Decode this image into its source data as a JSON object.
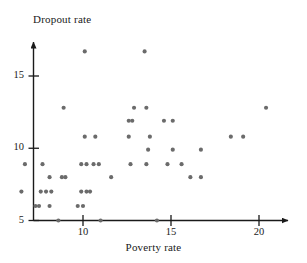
{
  "chart_data": {
    "type": "scatter",
    "title": "",
    "xlabel": "Poverty rate",
    "ylabel": "Dropout rate",
    "xlim": [
      6.2,
      21.6
    ],
    "ylim": [
      4.7,
      17.6
    ],
    "xticks": [
      10,
      15,
      20
    ],
    "yticks": [
      5,
      10,
      15
    ],
    "xtick_labels": [
      "10",
      "15",
      "20"
    ],
    "ytick_labels": [
      "5",
      "10",
      "15"
    ],
    "grid": false,
    "legend": null,
    "marker": {
      "shape": "circle",
      "color": "#6b6b6b",
      "size": 3.0
    },
    "axis_style": {
      "spines": [
        "left",
        "bottom"
      ],
      "arrow_heads": true,
      "color": "#1a1a1a"
    },
    "points": [
      {
        "x": 10.1,
        "y": 16.7
      },
      {
        "x": 13.5,
        "y": 16.7
      },
      {
        "x": 8.9,
        "y": 12.8
      },
      {
        "x": 12.9,
        "y": 12.8
      },
      {
        "x": 13.6,
        "y": 12.8
      },
      {
        "x": 20.4,
        "y": 12.8
      },
      {
        "x": 12.6,
        "y": 11.9
      },
      {
        "x": 12.8,
        "y": 11.9
      },
      {
        "x": 14.6,
        "y": 11.9
      },
      {
        "x": 15.1,
        "y": 11.9
      },
      {
        "x": 10.1,
        "y": 10.8
      },
      {
        "x": 10.7,
        "y": 10.8
      },
      {
        "x": 12.6,
        "y": 10.8
      },
      {
        "x": 13.8,
        "y": 10.8
      },
      {
        "x": 18.4,
        "y": 10.8
      },
      {
        "x": 19.1,
        "y": 10.8
      },
      {
        "x": 13.7,
        "y": 9.9
      },
      {
        "x": 15.1,
        "y": 9.9
      },
      {
        "x": 16.7,
        "y": 9.9
      },
      {
        "x": 6.7,
        "y": 8.9
      },
      {
        "x": 7.7,
        "y": 8.9
      },
      {
        "x": 9.9,
        "y": 8.9
      },
      {
        "x": 10.2,
        "y": 8.9
      },
      {
        "x": 10.6,
        "y": 8.9
      },
      {
        "x": 10.9,
        "y": 8.9
      },
      {
        "x": 12.7,
        "y": 8.9
      },
      {
        "x": 13.6,
        "y": 8.9
      },
      {
        "x": 14.8,
        "y": 8.9
      },
      {
        "x": 15.6,
        "y": 8.9
      },
      {
        "x": 8.1,
        "y": 8.0
      },
      {
        "x": 8.8,
        "y": 8.0
      },
      {
        "x": 9.0,
        "y": 8.0
      },
      {
        "x": 11.6,
        "y": 8.0
      },
      {
        "x": 16.1,
        "y": 8.0
      },
      {
        "x": 16.7,
        "y": 8.0
      },
      {
        "x": 6.5,
        "y": 7.0
      },
      {
        "x": 7.6,
        "y": 7.0
      },
      {
        "x": 7.9,
        "y": 7.0
      },
      {
        "x": 8.2,
        "y": 7.0
      },
      {
        "x": 9.9,
        "y": 7.0
      },
      {
        "x": 10.2,
        "y": 7.0
      },
      {
        "x": 10.4,
        "y": 7.0
      },
      {
        "x": 7.3,
        "y": 6.0
      },
      {
        "x": 7.5,
        "y": 6.0
      },
      {
        "x": 8.1,
        "y": 6.0
      },
      {
        "x": 9.7,
        "y": 6.0
      },
      {
        "x": 10.0,
        "y": 6.0
      },
      {
        "x": 8.6,
        "y": 5.0
      },
      {
        "x": 11.0,
        "y": 5.0
      },
      {
        "x": 14.2,
        "y": 5.0
      }
    ]
  },
  "axes": {
    "y_title": "Dropout rate",
    "x_title": "Poverty rate",
    "y_ticks": [
      {
        "value": 15,
        "label": "15"
      },
      {
        "value": 10,
        "label": "10"
      },
      {
        "value": 5,
        "label": "5"
      }
    ],
    "x_ticks": [
      {
        "value": 10,
        "label": "10"
      },
      {
        "value": 15,
        "label": "15"
      },
      {
        "value": 20,
        "label": "20"
      }
    ]
  }
}
